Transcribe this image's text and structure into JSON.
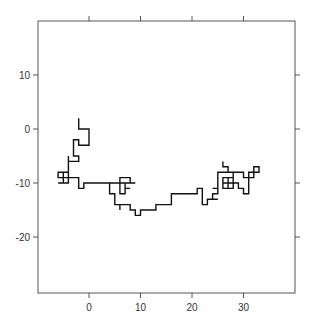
{
  "chart_data": {
    "type": "line",
    "title": "",
    "xlabel": "",
    "ylabel": "",
    "xlim": [
      -10,
      40
    ],
    "ylim": [
      -30,
      20
    ],
    "xticks": [
      0,
      10,
      20,
      30
    ],
    "yticks": [
      10,
      0,
      -10,
      -20
    ],
    "xtick_labels": [
      "0",
      "10",
      "20",
      "30"
    ],
    "ytick_labels": [
      "10",
      "0",
      "-10",
      "-20"
    ],
    "grid": false,
    "legend": null,
    "series": [
      {
        "name": "random walk",
        "color": "#111111",
        "points": [
          [
            -2,
            2
          ],
          [
            -2,
            0
          ],
          [
            0,
            0
          ],
          [
            0,
            -3
          ],
          [
            -2,
            -3
          ],
          [
            -2,
            -2
          ],
          [
            -3,
            -2
          ],
          [
            -3,
            -5
          ],
          [
            -2,
            -5
          ],
          [
            -2,
            -6
          ],
          [
            -4,
            -6
          ],
          [
            -4,
            -5
          ],
          [
            -4,
            -10
          ],
          [
            -6,
            -10
          ],
          [
            -4,
            -10
          ],
          [
            -4,
            -8
          ],
          [
            -5,
            -8
          ],
          [
            -5,
            -10
          ],
          [
            -4,
            -10
          ],
          [
            -4,
            -9
          ],
          [
            -6,
            -9
          ],
          [
            -6,
            -8
          ],
          [
            -5,
            -8
          ],
          [
            -5,
            -9
          ],
          [
            -2,
            -9
          ],
          [
            -2,
            -11
          ],
          [
            -1,
            -11
          ],
          [
            -1,
            -10
          ],
          [
            4,
            -10
          ],
          [
            4,
            -12
          ],
          [
            5,
            -12
          ],
          [
            5,
            -14
          ],
          [
            6,
            -14
          ],
          [
            6,
            -15
          ],
          [
            6,
            -14
          ],
          [
            8,
            -14
          ],
          [
            8,
            -15
          ],
          [
            9,
            -15
          ],
          [
            9,
            -16
          ],
          [
            10,
            -16
          ],
          [
            10,
            -15
          ],
          [
            13,
            -15
          ],
          [
            13,
            -14
          ],
          [
            16,
            -14
          ],
          [
            16,
            -12
          ],
          [
            21,
            -12
          ],
          [
            21,
            -11
          ],
          [
            22,
            -11
          ],
          [
            22,
            -14
          ],
          [
            23,
            -14
          ],
          [
            23,
            -13
          ],
          [
            25,
            -13
          ],
          [
            24,
            -13
          ],
          [
            24,
            -12
          ],
          [
            25,
            -12
          ],
          [
            25,
            -11
          ],
          [
            24,
            -11
          ],
          [
            25,
            -11
          ],
          [
            25,
            -8
          ],
          [
            30,
            -8
          ],
          [
            30,
            -9
          ],
          [
            32,
            -9
          ],
          [
            32,
            -8
          ],
          [
            33,
            -8
          ],
          [
            33,
            -7
          ],
          [
            32,
            -7
          ],
          [
            32,
            -8
          ],
          [
            31,
            -8
          ],
          [
            31,
            -12
          ],
          [
            30,
            -12
          ],
          [
            30,
            -11
          ],
          [
            29,
            -11
          ],
          [
            29,
            -10
          ],
          [
            28,
            -10
          ],
          [
            28,
            -9
          ],
          [
            26,
            -9
          ],
          [
            26,
            -11
          ],
          [
            28,
            -11
          ],
          [
            28,
            -10
          ],
          [
            26,
            -10
          ],
          [
            27,
            -10
          ],
          [
            27,
            -11
          ],
          [
            27,
            -9
          ],
          [
            28,
            -9
          ],
          [
            28,
            -8
          ],
          [
            27,
            -8
          ],
          [
            27,
            -7
          ],
          [
            26,
            -7
          ],
          [
            26,
            -6
          ]
        ]
      },
      {
        "name": "middle branch",
        "color": "#111111",
        "points": [
          [
            4,
            -10
          ],
          [
            9,
            -10
          ],
          [
            8,
            -10
          ],
          [
            8,
            -9
          ],
          [
            6,
            -9
          ],
          [
            6,
            -12
          ],
          [
            7,
            -12
          ],
          [
            7,
            -11
          ],
          [
            8,
            -11
          ],
          [
            7,
            -11
          ],
          [
            7,
            -10
          ],
          [
            8,
            -10
          ]
        ]
      }
    ]
  }
}
